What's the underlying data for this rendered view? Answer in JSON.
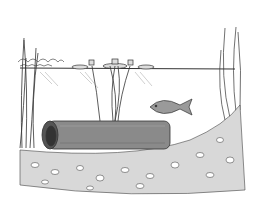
{
  "illustration": {
    "subject": "Underwater pond scene line drawing",
    "elements": [
      "water-surface",
      "tall-reeds-left",
      "water-lily-pads",
      "lily-stems",
      "fish",
      "drainage-pipe",
      "gravel-bottom",
      "plants-right"
    ]
  },
  "colors": {
    "background": "#ffffff",
    "ink": "#222222",
    "pipe_fill": "#8a8a8a",
    "pipe_dark": "#555555",
    "fish_fill": "#9a9a9a",
    "gravel_fill": "#d8d8d8"
  }
}
